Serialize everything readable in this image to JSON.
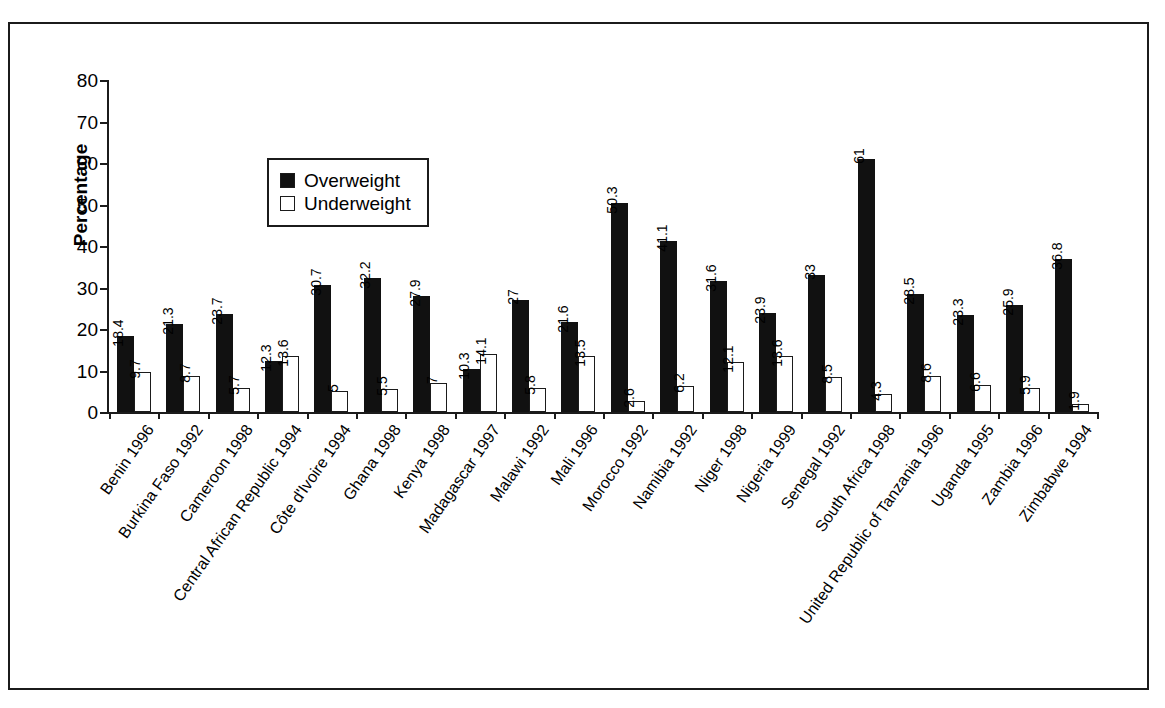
{
  "scan": {
    "bleed_top_text": ""
  },
  "legend": {
    "position": "inside-top-left",
    "items": [
      {
        "label": "Overweight",
        "swatch": "filled-square",
        "color": "#111111"
      },
      {
        "label": "Underweight",
        "swatch": "hollow-square",
        "color": "#ffffff"
      }
    ]
  },
  "axes": {
    "y_title": "Percentage",
    "y_ticks": [
      0,
      10,
      20,
      30,
      40,
      50,
      60,
      70,
      80
    ]
  },
  "chart_data": {
    "type": "bar",
    "title": "",
    "subtitle": "",
    "xlabel": "",
    "ylabel": "Percentage",
    "ylim": [
      0,
      80
    ],
    "ytick_step": 10,
    "grid": false,
    "legend_position": "upper-left-inside",
    "orientation": "vertical",
    "grouping": "grouped",
    "value_labels": true,
    "value_label_rotation": -90,
    "category_label_rotation": -55,
    "categories": [
      "Benin 1996",
      "Burkina Faso 1992",
      "Cameroon 1998",
      "Central African Republic 1994",
      "Côte d'Ivoire 1994",
      "Ghana 1998",
      "Kenya 1998",
      "Madagascar 1997",
      "Malawi 1992",
      "Mali 1996",
      "Morocco 1992",
      "Namibia 1992",
      "Niger 1998",
      "Nigeria 1999",
      "Senegal 1992",
      "South Africa 1998",
      "United Republic of Tanzania 1996",
      "Uganda 1995",
      "Zambia 1996",
      "Zimbabwe 1994"
    ],
    "series": [
      {
        "name": "Overweight",
        "color": "#111111",
        "values": [
          18.4,
          21.3,
          23.7,
          12.3,
          30.7,
          32.2,
          27.9,
          10.3,
          27,
          21.6,
          50.3,
          41.1,
          31.6,
          23.9,
          33,
          61,
          28.5,
          23.3,
          25.9,
          36.8
        ],
        "labels": [
          "18.4",
          "21.3",
          "23.7",
          "12.3",
          "30.7",
          "32.2",
          "27.9",
          "10.3",
          "27",
          "21.6",
          "50.3",
          "41.1",
          "31.6",
          "23.9",
          "33",
          "61",
          "28.5",
          "23.3",
          "25.9",
          "36.8"
        ]
      },
      {
        "name": "Underweight",
        "color": "#ffffff",
        "values": [
          9.7,
          8.7,
          5.7,
          13.6,
          5,
          5.5,
          7,
          14.1,
          5.8,
          13.5,
          2.6,
          6.2,
          12.1,
          13.6,
          8.5,
          4.3,
          8.6,
          6.6,
          5.9,
          1.9
        ],
        "labels": [
          "9.7",
          "8.7",
          "5.7",
          "13.6",
          "5",
          "5.5",
          "7",
          "14.1",
          "5.8",
          "13.5",
          "2.6",
          "6.2",
          "12.1",
          "13.6",
          "8.5",
          "4.3",
          "8.6",
          "6.6",
          "5.9",
          "1.9"
        ]
      }
    ]
  }
}
